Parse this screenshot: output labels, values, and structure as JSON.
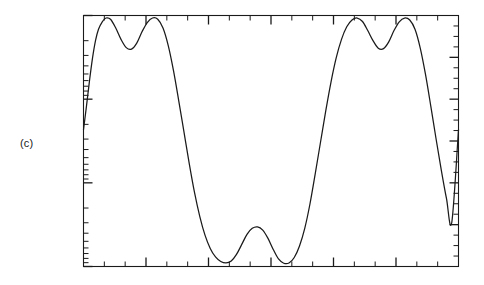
{
  "figure": {
    "panel_label": "(c)",
    "background_color": "#ffffff",
    "line_color": "#1a1a1a"
  },
  "chart_data": {
    "type": "line",
    "title": "",
    "subtitle": "",
    "xlabel": "",
    "ylabel": "",
    "panel_label": "(c)",
    "grid": false,
    "legend": null,
    "legend_position": "none",
    "axis_tick_labels_shown": false,
    "xlim": [
      0,
      1
    ],
    "ylim": [
      0,
      1
    ],
    "x_axis": {
      "scale": "linear",
      "major_tick_count": 5,
      "minor_tick_count": 12,
      "ticks_inward": true,
      "tick_labels": []
    },
    "y_axis": {
      "scale": "log",
      "major_tick_count": 3,
      "minor_tick_count": 19,
      "ticks_inward": true,
      "tick_labels": []
    },
    "cycles": 3,
    "series": [
      {
        "name": "waveform",
        "color": "#1a1a1a",
        "x": [
          0.0,
          0.008,
          0.016,
          0.024,
          0.032,
          0.04,
          0.05,
          0.06,
          0.072,
          0.086,
          0.1,
          0.114,
          0.128,
          0.142,
          0.156,
          0.17,
          0.184,
          0.198,
          0.212,
          0.226,
          0.24,
          0.254,
          0.268,
          0.282,
          0.296,
          0.31,
          0.324,
          0.338,
          0.352,
          0.366,
          0.38,
          0.394,
          0.408,
          0.422,
          0.436,
          0.45,
          0.464,
          0.478,
          0.492,
          0.506,
          0.52,
          0.534,
          0.548,
          0.562,
          0.576,
          0.59,
          0.604,
          0.618,
          0.632,
          0.646,
          0.66,
          0.674,
          0.688,
          0.702,
          0.716,
          0.73,
          0.744,
          0.758,
          0.772,
          0.786,
          0.8,
          0.814,
          0.828,
          0.842,
          0.856,
          0.87,
          0.884,
          0.898,
          0.912,
          0.926,
          0.94,
          0.954,
          0.968,
          0.982,
          1.0
        ],
        "y": [
          0.545,
          0.64,
          0.74,
          0.83,
          0.9,
          0.945,
          0.975,
          0.99,
          0.985,
          0.95,
          0.905,
          0.872,
          0.866,
          0.89,
          0.935,
          0.972,
          0.99,
          0.985,
          0.95,
          0.88,
          0.78,
          0.66,
          0.535,
          0.41,
          0.295,
          0.2,
          0.125,
          0.072,
          0.038,
          0.02,
          0.014,
          0.022,
          0.048,
          0.088,
          0.128,
          0.152,
          0.158,
          0.145,
          0.112,
          0.068,
          0.03,
          0.013,
          0.014,
          0.036,
          0.082,
          0.152,
          0.25,
          0.37,
          0.495,
          0.62,
          0.735,
          0.832,
          0.905,
          0.955,
          0.982,
          0.99,
          0.976,
          0.94,
          0.9,
          0.87,
          0.868,
          0.895,
          0.94,
          0.975,
          0.99,
          0.982,
          0.945,
          0.87,
          0.765,
          0.64,
          0.51,
          0.385,
          0.27,
          0.175,
          0.545
        ]
      }
    ]
  }
}
